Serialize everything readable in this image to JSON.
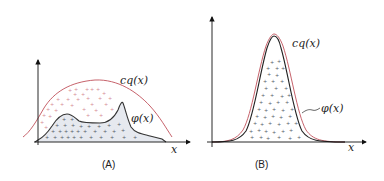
{
  "figure": {
    "panels": [
      {
        "id": "A",
        "caption": "(A)",
        "envelope_label": "cq(x)",
        "target_label": "φ(x)",
        "x_axis_label": "x",
        "envelope_color": "#c0505a",
        "target_color": "#333333",
        "fill_color": "#e6e9ef"
      },
      {
        "id": "B",
        "caption": "(B)",
        "envelope_label": "cq(x)",
        "target_label": "φ(x)",
        "x_axis_label": "x",
        "envelope_color": "#c0505a",
        "target_color": "#222222"
      }
    ]
  }
}
